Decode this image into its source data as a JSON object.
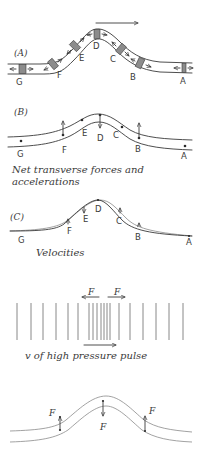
{
  "panels": {
    "a": {
      "label": "(A)",
      "direction_arrow": "propagation direction →",
      "points": [
        "G",
        "F",
        "E",
        "D",
        "C",
        "B",
        "A"
      ]
    },
    "b": {
      "label": "(B)",
      "points": [
        "G",
        "F",
        "E",
        "D",
        "C",
        "B",
        "A"
      ],
      "caption_line1": "Net transverse forces and",
      "caption_line2": "accelerations"
    },
    "c": {
      "label": "(C)",
      "points": [
        "G",
        "F",
        "E",
        "D",
        "C",
        "B",
        "A"
      ],
      "caption": "Velocities"
    },
    "d": {
      "force_left": "F",
      "force_right": "F",
      "caption": "v of high pressure pulse"
    },
    "e": {
      "force_left": "F",
      "force_center": "F",
      "force_right": "F"
    }
  },
  "colors": {
    "ink": "#3a3a3a",
    "shading": "#8c8c8c",
    "background": "#ffffff"
  }
}
